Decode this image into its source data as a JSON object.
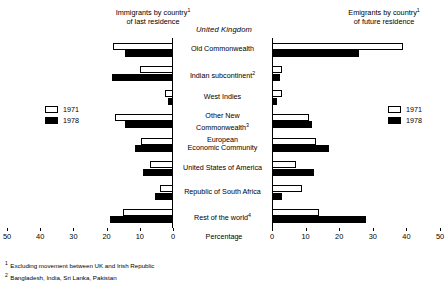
{
  "title": "United Kingdom",
  "panels": {
    "left": {
      "heading_line1": "Immigrants by country",
      "heading_sup": "1",
      "heading_line2": "of last residence"
    },
    "right": {
      "heading_line1": "Emigrants by country",
      "heading_sup": "1",
      "heading_line2": "of future residence"
    }
  },
  "axis": {
    "caption": "Percentage",
    "ticks_left": [
      "50",
      "40",
      "30",
      "20",
      "10",
      "0"
    ],
    "ticks_right": [
      "0",
      "10",
      "20",
      "30",
      "40",
      "50"
    ],
    "max": 50
  },
  "legend": {
    "series1_label": "1971",
    "series2_label": "1978",
    "series1_color": "#ffffff",
    "series2_color": "#000000"
  },
  "footnotes": [
    {
      "num": "1",
      "text": "Excluding movement between UK and Irish Republic"
    },
    {
      "num": "2",
      "text": "Bangladesh, India, Sri Lanka, Pakistan"
    }
  ],
  "chart_data": {
    "type": "bar",
    "title": "United Kingdom",
    "subtitle": "Immigrants by country of last residence / Emigrants by country of future residence",
    "orientation": "horizontal",
    "layout": "back-to-back population pyramid, two mirrored panels sharing central category labels",
    "xlabel": "Percentage",
    "ylabel": "",
    "xlim": [
      0,
      50
    ],
    "xticks": [
      0,
      10,
      20,
      30,
      40,
      50
    ],
    "grid": false,
    "legend_position": "left-and-right-middle",
    "categories": [
      "Old Commonwealth",
      "Indian subcontinent",
      "West Indies",
      "Other New Commonwealth",
      "European Economic Community",
      "United States of America",
      "Republic of South Africa",
      "Rest of the world"
    ],
    "category_footnote_refs": [
      "",
      "2",
      "",
      "3",
      "",
      "",
      "",
      "4"
    ],
    "category_labels_display": [
      "Old Commonwealth",
      "Indian subcontinent",
      "West Indies",
      "Other New|Commonwealth",
      "European|Economic Community",
      "United States of America",
      "Republic of South Africa",
      "Rest of the world"
    ],
    "panels": [
      {
        "name": "Immigrants by country of last residence",
        "direction": "left",
        "series": [
          {
            "name": "1971",
            "values": [
              18.0,
              10.0,
              2.5,
              17.5,
              9.5,
              7.0,
              4.0,
              15.0
            ]
          },
          {
            "name": "1978",
            "values": [
              14.5,
              18.5,
              1.5,
              14.5,
              11.5,
              9.0,
              5.5,
              19.0
            ]
          }
        ]
      },
      {
        "name": "Emigrants by country of future residence",
        "direction": "right",
        "series": [
          {
            "name": "1971",
            "values": [
              39.0,
              3.0,
              3.0,
              11.0,
              13.0,
              7.0,
              9.0,
              14.0
            ]
          },
          {
            "name": "1978",
            "values": [
              26.0,
              2.5,
              1.5,
              12.0,
              17.0,
              12.5,
              3.0,
              28.0
            ]
          }
        ]
      }
    ]
  }
}
